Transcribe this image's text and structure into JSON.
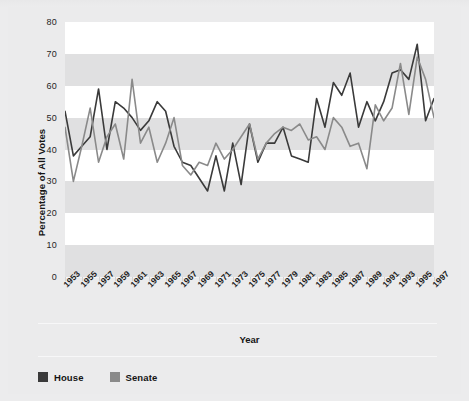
{
  "chart_data": {
    "type": "line",
    "title": "",
    "xlabel": "Year",
    "ylabel": "Percentage of All Votes",
    "ylim": [
      0,
      80
    ],
    "yticks": [
      0,
      10,
      20,
      30,
      40,
      50,
      60,
      70,
      80
    ],
    "xlim": [
      1953,
      1997
    ],
    "xtick_labels": [
      "1953",
      "1955",
      "1957",
      "1959",
      "1961",
      "1963",
      "1965",
      "1967",
      "1969",
      "1971",
      "1973",
      "1975",
      "1977",
      "1979",
      "1981",
      "1983",
      "1985",
      "1987",
      "1989",
      "1991",
      "1993",
      "1995",
      "1997"
    ],
    "grid": "horizontal-alternating-bands",
    "legend_position": "bottom-left",
    "x": [
      1953,
      1954,
      1955,
      1956,
      1957,
      1958,
      1959,
      1960,
      1961,
      1962,
      1963,
      1964,
      1965,
      1966,
      1967,
      1968,
      1969,
      1970,
      1971,
      1972,
      1973,
      1974,
      1975,
      1976,
      1977,
      1978,
      1979,
      1980,
      1981,
      1982,
      1983,
      1984,
      1985,
      1986,
      1987,
      1988,
      1989,
      1990,
      1991,
      1992,
      1993,
      1994,
      1995,
      1996,
      1997
    ],
    "series": [
      {
        "name": "House",
        "color": "#3a3a3a",
        "values": [
          52,
          38,
          41,
          44,
          59,
          40,
          55,
          53,
          50,
          46,
          49,
          55,
          52,
          41,
          36,
          35,
          31,
          27,
          38,
          27,
          42,
          29,
          48,
          36,
          42,
          42,
          47,
          38,
          37,
          36,
          56,
          47,
          61,
          57,
          64,
          47,
          55,
          49,
          55,
          64,
          65,
          62,
          73,
          49,
          56
        ]
      },
      {
        "name": "Senate",
        "color": "#8a8a8a",
        "values": [
          47,
          30,
          41,
          53,
          36,
          44,
          48,
          37,
          62,
          42,
          47,
          36,
          42,
          50,
          35,
          32,
          36,
          35,
          42,
          37,
          40,
          44,
          48,
          37,
          42,
          45,
          47,
          46,
          48,
          43,
          44,
          40,
          50,
          47,
          41,
          42,
          34,
          54,
          49,
          53,
          67,
          51,
          69,
          62,
          50
        ]
      }
    ]
  },
  "legend": {
    "items": [
      {
        "label": "House",
        "color": "#3a3a3a"
      },
      {
        "label": "Senate",
        "color": "#8a8a8a"
      }
    ]
  },
  "axes": {
    "y_title": "Percentage of All Votes",
    "x_title": "Year"
  }
}
